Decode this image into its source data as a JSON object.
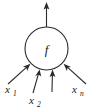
{
  "figure": {
    "type": "node-diagram",
    "background_color": "#ffffff",
    "stroke_color": "#2b2b2b",
    "text_color": "#1a1a1a"
  },
  "node": {
    "label": "f",
    "shape": "circle",
    "center_x": 46.5,
    "center_y": 48.5,
    "radius": 21.5
  },
  "output": {
    "name": "output-arrow",
    "direction": "up",
    "label": "",
    "start_x": 46.5,
    "start_y": 27,
    "end_x": 46.5,
    "end_y": 3
  },
  "inputs": [
    {
      "name": "input-1",
      "label": "x",
      "subscript": "1",
      "label_x": 5,
      "label_y": 93,
      "sub_x": 13.5,
      "sub_y": 96,
      "tail_x": 8,
      "tail_y": 84,
      "head_x": 30,
      "head_y": 64
    },
    {
      "name": "input-2",
      "label": "x",
      "subscript": "2",
      "label_x": 29,
      "label_y": 104,
      "sub_x": 37.5,
      "sub_y": 107,
      "tail_x": 33,
      "tail_y": 93,
      "head_x": 39.5,
      "head_y": 70
    },
    {
      "name": "input-3",
      "label": "",
      "subscript": "",
      "label_x": 0,
      "label_y": 0,
      "sub_x": 0,
      "sub_y": 0,
      "tail_x": 52,
      "tail_y": 92,
      "head_x": 52.5,
      "head_y": 70
    },
    {
      "name": "input-n",
      "label": "x",
      "subscript": "n",
      "label_x": 72,
      "label_y": 93,
      "sub_x": 80.5,
      "sub_y": 96,
      "tail_x": 86,
      "tail_y": 84,
      "head_x": 63.5,
      "head_y": 64
    }
  ]
}
